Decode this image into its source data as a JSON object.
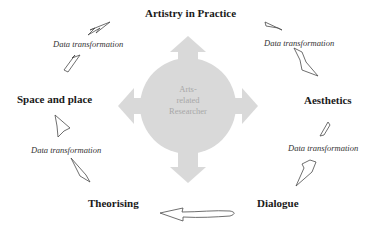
{
  "diagram": {
    "center": {
      "label_lines": [
        "Arts-",
        "related",
        "Researcher"
      ],
      "fill_color": "#d9d9d9"
    },
    "nodes": [
      {
        "id": "artistry",
        "label": "Artistry in Practice"
      },
      {
        "id": "aesthetics",
        "label": "Aesthetics"
      },
      {
        "id": "dialogue",
        "label": "Dialogue"
      },
      {
        "id": "theorising",
        "label": "Theorising"
      },
      {
        "id": "space",
        "label": "Space and place"
      }
    ],
    "transitions": [
      {
        "from": "space",
        "to": "artistry",
        "label": "Data transformation"
      },
      {
        "from": "artistry",
        "to": "aesthetics",
        "label": "Data transformation"
      },
      {
        "from": "aesthetics",
        "to": "dialogue",
        "label": "Data transformation"
      },
      {
        "from": "theorising",
        "to": "space",
        "label": "Data transformation"
      },
      {
        "from": "dialogue",
        "to": "theorising",
        "label": ""
      }
    ],
    "colors": {
      "text": "#1a1a1a",
      "arrow_outline": "#4a4a4a",
      "center_shape": "#d9d9d9",
      "center_text": "#a8a8a8"
    }
  }
}
